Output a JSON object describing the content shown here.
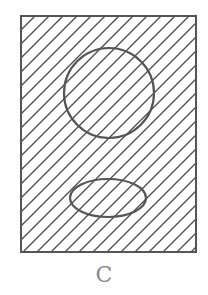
{
  "diagram": {
    "type": "venn-style set diagram",
    "caption": "C",
    "universe": {
      "shape": "rectangle",
      "x": 21,
      "y": 16,
      "width": 175,
      "height": 236,
      "shaded": true,
      "hatch": "diagonal lines"
    },
    "sets": [
      {
        "shape": "circle",
        "cx": 109,
        "cy": 93,
        "r": 45,
        "shaded": true
      },
      {
        "shape": "ellipse",
        "cx": 108,
        "cy": 198,
        "rx": 38,
        "ry": 19,
        "shaded": true
      }
    ],
    "colors": {
      "stroke": "#555555",
      "hatch": "#4a4a4a",
      "caption": "#8a8a8a",
      "background": "#ffffff"
    }
  }
}
